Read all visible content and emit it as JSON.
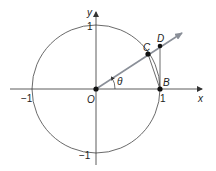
{
  "diagram": {
    "type": "unit-circle-geometry",
    "axes": {
      "x_label": "x",
      "y_label": "y",
      "ticks": {
        "x_neg": "−1",
        "x_pos": "1",
        "y_pos": "1",
        "y_neg": "−1"
      }
    },
    "points": {
      "origin": "O",
      "B": "B",
      "C": "C",
      "D": "D"
    },
    "angle_label": "θ",
    "colors": {
      "lines": "#333333",
      "ray": "#8a8f98",
      "points": "#111111",
      "background": "#ffffff"
    }
  }
}
